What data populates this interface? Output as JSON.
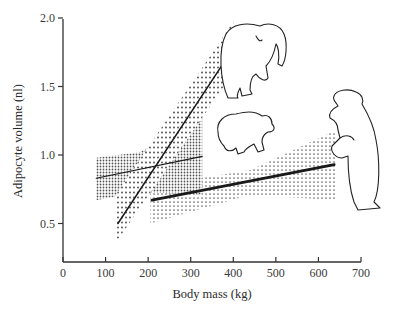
{
  "chart_data": {
    "type": "line",
    "title": "",
    "xlabel": "Body mass (kg)",
    "ylabel": "Adipocyte volume (nl)",
    "xlim": [
      0,
      700
    ],
    "ylim": [
      0.25,
      2.0
    ],
    "x_ticks": [
      0,
      100,
      200,
      300,
      400,
      500,
      600,
      700
    ],
    "x_tick_labels": [
      "0",
      "100",
      "200",
      "300",
      "400",
      "500",
      "600",
      "700"
    ],
    "y_ticks": [
      0.5,
      1.0,
      1.5,
      2.0
    ],
    "y_tick_labels": [
      "0.5",
      "1.0",
      "1.5",
      "2.0"
    ],
    "grid": false,
    "legend": "none (bear illustrations label the series)",
    "series": [
      {
        "name": "steep regression (small bears, cub-like)",
        "style": "thin solid line, sparse dotted confidence band",
        "x": [
          129,
          400
        ],
        "y": [
          0.5,
          1.78
        ],
        "band": {
          "x": [
            122,
            400
          ],
          "upper": [
            0.7,
            1.97
          ],
          "lower": [
            0.35,
            1.6
          ]
        }
      },
      {
        "name": "shallow regression (medium bears)",
        "style": "thin solid line, dense fine-dot confidence band",
        "x": [
          78,
          327
        ],
        "y": [
          0.83,
          0.99
        ],
        "band": {
          "x": [
            78,
            180,
            327
          ],
          "upper": [
            0.98,
            1.02,
            1.27
          ],
          "lower": [
            0.67,
            0.73,
            0.71
          ]
        }
      },
      {
        "name": "adult regression (large bears)",
        "style": "thick solid line, coarse dotted confidence band",
        "x": [
          209,
          637
        ],
        "y": [
          0.67,
          0.93
        ],
        "band": {
          "x": [
            205,
            440,
            641
          ],
          "upper": [
            0.77,
            0.89,
            1.18
          ],
          "lower": [
            0.5,
            0.71,
            0.67
          ]
        }
      }
    ],
    "annotations": [
      "standing adult bear illustration",
      "walking bear illustration",
      "cub illustration"
    ]
  }
}
